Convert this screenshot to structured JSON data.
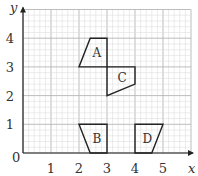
{
  "diagram": {
    "type": "coordinate-grid-with-shapes",
    "axes": {
      "x_label": "x",
      "y_label": "y",
      "origin_label": "0",
      "x_ticks": [
        "1",
        "2",
        "3",
        "4",
        "5"
      ],
      "y_ticks": [
        "1",
        "2",
        "3",
        "4"
      ],
      "x_range": [
        0,
        6
      ],
      "y_range": [
        0,
        5
      ],
      "minor_grid_step": 0.2
    },
    "shapes": [
      {
        "label": "A",
        "vertices": [
          [
            2,
            3
          ],
          [
            3,
            3
          ],
          [
            3,
            4
          ],
          [
            2.4,
            4
          ]
        ]
      },
      {
        "label": "B",
        "vertices": [
          [
            2,
            1
          ],
          [
            3,
            1
          ],
          [
            3,
            0
          ],
          [
            2.4,
            0
          ]
        ]
      },
      {
        "label": "C",
        "vertices": [
          [
            3,
            3
          ],
          [
            4,
            3
          ],
          [
            4,
            2.4
          ],
          [
            3,
            2
          ]
        ]
      },
      {
        "label": "D",
        "vertices": [
          [
            4,
            1
          ],
          [
            5,
            1
          ],
          [
            4.6,
            0
          ],
          [
            4,
            0
          ]
        ]
      }
    ],
    "colors": {
      "minor_grid": "#d9d9d9",
      "major_grid": "#b5b5b5",
      "axis": "#222222",
      "shape_stroke": "#222222",
      "text": "#333333"
    }
  }
}
